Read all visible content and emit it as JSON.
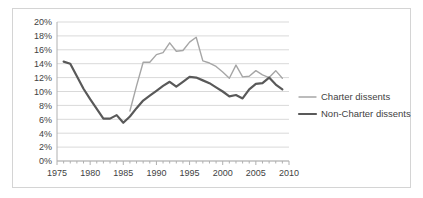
{
  "chart_data": {
    "type": "line",
    "title": "",
    "subtitle": "",
    "xlabel": "",
    "ylabel": "",
    "xlim": [
      1975,
      2010
    ],
    "ylim": [
      0,
      20
    ],
    "grid": true,
    "grid_orientation": "horizontal",
    "legend_position": "right",
    "ytick_labels": [
      "20%",
      "18%",
      "16%",
      "14%",
      "12%",
      "10%",
      "8%",
      "6%",
      "4%",
      "2%",
      "0%"
    ],
    "ytick_values": [
      20,
      18,
      16,
      14,
      12,
      10,
      8,
      6,
      4,
      2,
      0
    ],
    "xtick_labels": [
      "1975",
      "1980",
      "1985",
      "1990",
      "1995",
      "2000",
      "2005",
      "2010"
    ],
    "xtick_values": [
      1975,
      1980,
      1985,
      1990,
      1995,
      2000,
      2005,
      2010
    ],
    "x_minor_tick_interval": 1,
    "series": [
      {
        "name": "Charter dissents",
        "color": "#a6a6a6",
        "line_width": 1.4,
        "x": [
          1986,
          1987,
          1988,
          1989,
          1990,
          1991,
          1992,
          1993,
          1994,
          1995,
          1996,
          1997,
          1998,
          1999,
          2000,
          2001,
          2002,
          2003,
          2004,
          2005,
          2006,
          2007,
          2008,
          2009
        ],
        "values": [
          7.2,
          10.8,
          14.2,
          14.2,
          15.3,
          15.6,
          17.0,
          15.8,
          15.9,
          17.1,
          17.8,
          14.4,
          14.1,
          13.6,
          12.8,
          11.9,
          13.8,
          12.1,
          12.2,
          13.0,
          12.4,
          12.0,
          13.0,
          11.9
        ]
      },
      {
        "name": "Non-Charter dissents",
        "color": "#595959",
        "line_width": 2.2,
        "x": [
          1976,
          1977,
          1978,
          1979,
          1980,
          1981,
          1982,
          1983,
          1984,
          1985,
          1986,
          1987,
          1988,
          1989,
          1990,
          1991,
          1992,
          1993,
          1994,
          1995,
          1996,
          1997,
          1998,
          1999,
          2000,
          2001,
          2002,
          2003,
          2004,
          2005,
          2006,
          2007,
          2008,
          2009
        ],
        "values": [
          14.3,
          14.0,
          12.2,
          10.4,
          8.9,
          7.5,
          6.1,
          6.1,
          6.6,
          5.5,
          6.4,
          7.6,
          8.7,
          9.4,
          10.1,
          10.8,
          11.4,
          10.7,
          11.4,
          12.1,
          12.0,
          11.6,
          11.2,
          10.6,
          10.0,
          9.3,
          9.5,
          9.0,
          10.3,
          11.1,
          11.2,
          12.0,
          11.0,
          10.3
        ]
      }
    ]
  },
  "legend": {
    "entries": [
      {
        "label": "Charter dissents",
        "color": "#a6a6a6"
      },
      {
        "label": "Non-Charter dissents",
        "color": "#595959"
      }
    ]
  },
  "colors": {
    "charter": "#a6a6a6",
    "non_charter": "#595959",
    "gridline": "#d9d9d9",
    "axis": "#b0b0b0",
    "frame": "#d4d4d4",
    "text": "#3f3f3f"
  }
}
